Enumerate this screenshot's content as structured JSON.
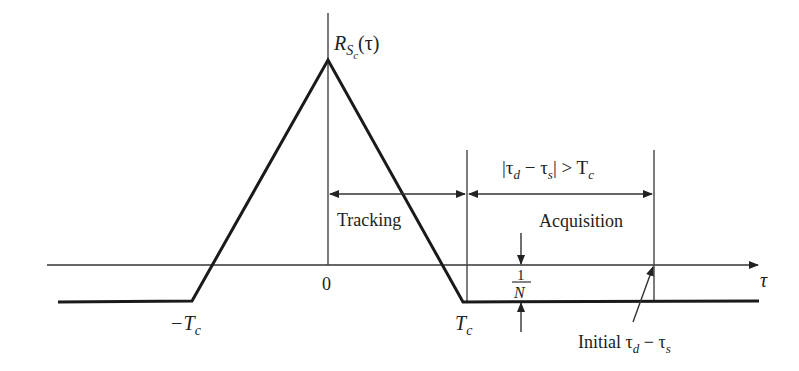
{
  "figure": {
    "function_label": "R",
    "function_sub": "S",
    "function_subsub": "c",
    "function_arg": "(τ)",
    "axis_label": "τ",
    "origin_label": "0",
    "neg_tc_label": "−T",
    "tc_label": "T",
    "tc_sub": "c",
    "tracking_label": "Tracking",
    "acquisition_label": "Acquisition",
    "condition_label": {
      "open": "|τ",
      "sub1": "d",
      "mid": " − τ",
      "sub2": "s",
      "close": "| > T",
      "sub3": "c"
    },
    "floor_numer": "1",
    "floor_denom": "N",
    "initial_label": {
      "word": "Initial ",
      "t1": "τ",
      "s1": "d",
      "mid": " − τ",
      "s2": "s"
    }
  }
}
